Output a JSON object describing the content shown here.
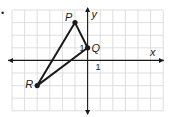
{
  "bullet": "•",
  "grid": {
    "left": 12,
    "top": 10,
    "cell": 12.6,
    "cols": 12,
    "rows": 8,
    "origin_col": 6,
    "origin_row": 4,
    "line_color": "#d6d6d6",
    "axis_color": "#1a1a1a"
  },
  "axes": {
    "x_label": "x",
    "y_label": "y",
    "x_tick_label": "1",
    "y_tick_label": "1"
  },
  "triangle": {
    "stroke": "#1a1a1a",
    "points": [
      {
        "name": "P",
        "x": -1,
        "y": 3
      },
      {
        "name": "Q",
        "x": 0,
        "y": 1
      },
      {
        "name": "R",
        "x": -4,
        "y": -2
      }
    ]
  }
}
